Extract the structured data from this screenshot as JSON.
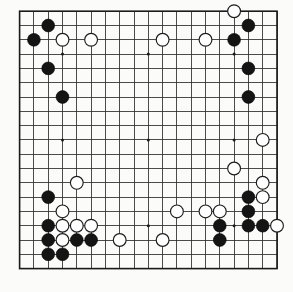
{
  "diagram": {
    "kind": "go-board-diagram",
    "board_size": 19,
    "colors": {
      "background": "#fbfbfa",
      "line": "#2b2b2b",
      "border": "#1a1a1a",
      "black_stone": "#141414",
      "white_stone": "#ffffff",
      "white_stone_outline": "#1c1c1c"
    },
    "geometry": {
      "origin_x": 19.6,
      "origin_y": 11.2,
      "spacing": 14.3,
      "stone_radius": 6.4,
      "star_radius": 1.5
    },
    "star_points": [
      [
        3,
        3
      ],
      [
        9,
        3
      ],
      [
        15,
        3
      ],
      [
        3,
        9
      ],
      [
        9,
        9
      ],
      [
        15,
        9
      ],
      [
        3,
        15
      ],
      [
        9,
        15
      ],
      [
        15,
        15
      ]
    ],
    "stones": {
      "black": [
        [
          2,
          1
        ],
        [
          1,
          2
        ],
        [
          2,
          4
        ],
        [
          3,
          6
        ],
        [
          16,
          1
        ],
        [
          15,
          2
        ],
        [
          16,
          4
        ],
        [
          16,
          6
        ],
        [
          2,
          13
        ],
        [
          2,
          15
        ],
        [
          2,
          16
        ],
        [
          2,
          17
        ],
        [
          3,
          17
        ],
        [
          4,
          16
        ],
        [
          5,
          16
        ],
        [
          14,
          15
        ],
        [
          14,
          16
        ],
        [
          16,
          13
        ],
        [
          16,
          14
        ],
        [
          16,
          15
        ],
        [
          17,
          15
        ]
      ],
      "white": [
        [
          5,
          2
        ],
        [
          10,
          2
        ],
        [
          13,
          2
        ],
        [
          15,
          0
        ],
        [
          3,
          2
        ],
        [
          17,
          9
        ],
        [
          4,
          12
        ],
        [
          15,
          11
        ],
        [
          17,
          12
        ],
        [
          17,
          13
        ],
        [
          3,
          14
        ],
        [
          3,
          15
        ],
        [
          3,
          16
        ],
        [
          4,
          15
        ],
        [
          5,
          15
        ],
        [
          7,
          16
        ],
        [
          10,
          16
        ],
        [
          11,
          14
        ],
        [
          13,
          14
        ],
        [
          14,
          14
        ],
        [
          18,
          15
        ]
      ]
    },
    "stone_count": {
      "black_label": "Black stones",
      "black_value": 21,
      "white_label": "White stones",
      "white_value": 21
    }
  }
}
